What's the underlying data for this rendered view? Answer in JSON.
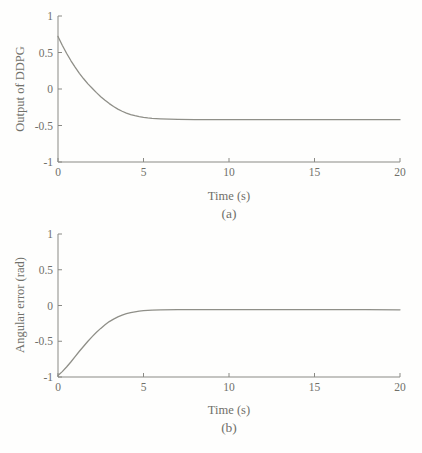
{
  "colors": {
    "axis": "#8a8a85",
    "tick_text": "#70706a",
    "series_line": "#8f8f88",
    "background": "#fefefd"
  },
  "chart_data": [
    {
      "type": "line",
      "caption": "(a)",
      "xlabel": "Time (s)",
      "ylabel": "Output of DDPG",
      "xlim": [
        0,
        20
      ],
      "ylim": [
        -1,
        1
      ],
      "x_tick_values": [
        0,
        5,
        10,
        15,
        20
      ],
      "x_tick_labels": [
        "0",
        "5",
        "10",
        "15",
        "20"
      ],
      "y_tick_values": [
        1,
        0.5,
        0,
        -0.5,
        -1
      ],
      "y_tick_labels": [
        "1",
        "0.5",
        "0",
        "-0.5",
        "-1"
      ],
      "grid": false,
      "legend": "none",
      "series": [
        {
          "points": [
            [
              0,
              0.72
            ],
            [
              0.25,
              0.6
            ],
            [
              0.5,
              0.49
            ],
            [
              0.75,
              0.39
            ],
            [
              1,
              0.3
            ],
            [
              1.25,
              0.215
            ],
            [
              1.5,
              0.14
            ],
            [
              1.75,
              0.07
            ],
            [
              2,
              0.01
            ],
            [
              2.25,
              -0.05
            ],
            [
              2.5,
              -0.105
            ],
            [
              2.75,
              -0.155
            ],
            [
              3,
              -0.2
            ],
            [
              3.25,
              -0.24
            ],
            [
              3.5,
              -0.275
            ],
            [
              3.75,
              -0.305
            ],
            [
              4,
              -0.33
            ],
            [
              4.25,
              -0.35
            ],
            [
              4.5,
              -0.365
            ],
            [
              4.75,
              -0.378
            ],
            [
              5,
              -0.388
            ],
            [
              5.25,
              -0.396
            ],
            [
              5.5,
              -0.402
            ],
            [
              5.75,
              -0.406
            ],
            [
              6,
              -0.409
            ],
            [
              6.5,
              -0.413
            ],
            [
              7,
              -0.416
            ],
            [
              8,
              -0.419
            ],
            [
              10,
              -0.42
            ],
            [
              12,
              -0.42
            ],
            [
              15,
              -0.42
            ],
            [
              18,
              -0.42
            ],
            [
              20,
              -0.42
            ]
          ]
        }
      ]
    },
    {
      "type": "line",
      "caption": "(b)",
      "xlabel": "Time (s)",
      "ylabel": "Angular error (rad)",
      "xlim": [
        0,
        20
      ],
      "ylim": [
        -1,
        1
      ],
      "x_tick_values": [
        0,
        5,
        10,
        15,
        20
      ],
      "x_tick_labels": [
        "0",
        "5",
        "10",
        "15",
        "20"
      ],
      "y_tick_values": [
        1,
        0.5,
        0,
        -0.5,
        -1
      ],
      "y_tick_labels": [
        "1",
        "0.5",
        "0",
        "-0.5",
        "-1"
      ],
      "grid": false,
      "legend": "none",
      "series": [
        {
          "points": [
            [
              0,
              -0.98
            ],
            [
              0.25,
              -0.925
            ],
            [
              0.5,
              -0.86
            ],
            [
              0.75,
              -0.79
            ],
            [
              1,
              -0.715
            ],
            [
              1.25,
              -0.64
            ],
            [
              1.5,
              -0.57
            ],
            [
              1.75,
              -0.5
            ],
            [
              2,
              -0.435
            ],
            [
              2.25,
              -0.375
            ],
            [
              2.5,
              -0.32
            ],
            [
              2.75,
              -0.27
            ],
            [
              3,
              -0.225
            ],
            [
              3.25,
              -0.19
            ],
            [
              3.5,
              -0.16
            ],
            [
              3.75,
              -0.135
            ],
            [
              4,
              -0.115
            ],
            [
              4.25,
              -0.1
            ],
            [
              4.5,
              -0.09
            ],
            [
              4.75,
              -0.08
            ],
            [
              5,
              -0.073
            ],
            [
              5.25,
              -0.068
            ],
            [
              5.5,
              -0.064
            ],
            [
              6,
              -0.06
            ],
            [
              7,
              -0.058
            ],
            [
              8,
              -0.057
            ],
            [
              10,
              -0.057
            ],
            [
              12,
              -0.058
            ],
            [
              15,
              -0.058
            ],
            [
              18,
              -0.059
            ],
            [
              20,
              -0.06
            ]
          ]
        }
      ]
    }
  ]
}
